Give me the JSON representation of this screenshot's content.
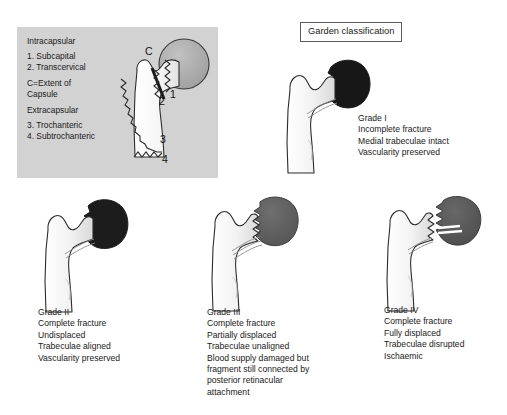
{
  "figure": {
    "title": "Garden classification",
    "background_color": "#ffffff"
  },
  "anatomy_panel": {
    "background_color": "#d2d2d2",
    "group_intracapsular_label": "Intracapsular",
    "items_intracapsular": [
      "1.  Subcapital",
      "2.  Transcervical"
    ],
    "capsule_note_line1": "C=Extent of",
    "capsule_note_line2": "Capsule",
    "group_extracapsular_label": "Extracapsular",
    "items_extracapsular": [
      "3.  Trochanteric",
      "4.  Subtrochanteric"
    ],
    "markers": {
      "capsule": "C",
      "subcapital": "1",
      "transcervical": "2",
      "trochanteric": "3",
      "subtrochanteric": "4"
    },
    "bone_fill": "#f2f2f2",
    "head_fill": "#a8a8a8"
  },
  "grades": [
    {
      "id": "grade-1",
      "name": "Grade I",
      "head_fill": "#171717",
      "lines": [
        "Grade I",
        "Incomplete fracture",
        "Medial trabeculae intact",
        "Vascularity preserved"
      ]
    },
    {
      "id": "grade-2",
      "name": "Grade II",
      "head_fill": "#1c1c1c",
      "lines": [
        "Grade II",
        "Complete fracture",
        "Undisplaced",
        "Trabeculae aligned",
        "Vascularity preserved"
      ]
    },
    {
      "id": "grade-3",
      "name": "Grade III",
      "head_fill": "#5e5e5e",
      "lines": [
        "Grade III",
        "Complete fracture",
        "Partially displaced",
        "Trabeculae unaligned",
        "Blood supply damaged but",
        "fragment still connected by",
        "posterior retinacular",
        "attachment"
      ]
    },
    {
      "id": "grade-4",
      "name": "Grade IV",
      "head_fill": "#555555",
      "lines": [
        "Grade IV",
        "Complete fracture",
        "Fully displaced",
        "Trabeculae disrupted",
        "Ischaemic"
      ]
    }
  ]
}
